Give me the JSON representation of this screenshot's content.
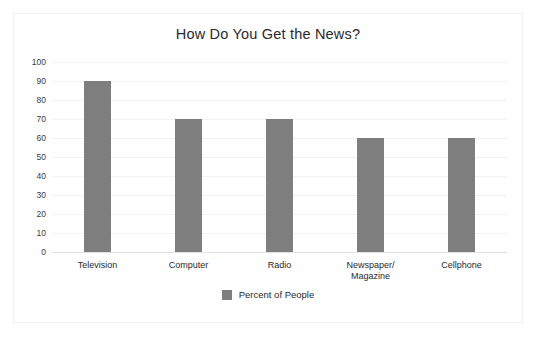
{
  "chart_data": {
    "type": "bar",
    "title": "How Do You Get the News?",
    "xlabel": "",
    "ylabel": "",
    "ylim": [
      0,
      100
    ],
    "yticks": [
      100,
      90,
      80,
      70,
      60,
      50,
      40,
      30,
      20,
      10,
      0
    ],
    "grid": true,
    "legend_position": "bottom",
    "categories": [
      "Television",
      "Computer",
      "Radio",
      "Newspaper/\nMagazine",
      "Cellphone"
    ],
    "series": [
      {
        "name": "Percent of People",
        "values": [
          90,
          70,
          70,
          60,
          60
        ],
        "color": "#7e7e7e"
      }
    ]
  },
  "legend": {
    "entries": [
      {
        "label": "Percent of People",
        "color": "#7e7e7e"
      }
    ]
  },
  "colors": {
    "bar": "#7e7e7e",
    "gridline": "#f2f2f4",
    "baseline": "#e2e2e4",
    "frame_border": "#f0f0f2",
    "background": "#ffffff",
    "text": "#2a2a2a"
  }
}
